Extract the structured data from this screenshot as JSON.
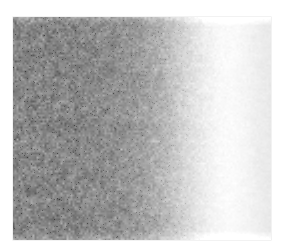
{
  "page": {
    "background_color": "#ffffff",
    "width": 285,
    "height": 249
  },
  "figure": {
    "name": "grayscale-gradient-micrograph",
    "plate": {
      "left": 13,
      "top": 17,
      "width": 258,
      "height": 223,
      "border_color": "#c8c8c8"
    }
  },
  "chart_data": {
    "type": "heatmap",
    "title": "",
    "subtitle": "",
    "xlabel": "",
    "ylabel": "",
    "colormap": "grayscale",
    "grid": false,
    "legend": "none",
    "axis_visible": false,
    "tick_labels_x": [],
    "tick_labels_y": [],
    "xlim": [
      0,
      258
    ],
    "ylim": [
      0,
      223
    ],
    "value_range": [
      0,
      255
    ],
    "x": [
      0,
      13,
      26,
      39,
      52,
      65,
      77,
      90,
      103,
      116,
      129,
      142,
      155,
      167,
      180,
      193,
      206,
      219,
      232,
      245,
      258
    ],
    "series": [
      {
        "name": "mean intensity (gray level 0-255)",
        "values": [
          136,
          135,
          134,
          134,
          135,
          136,
          138,
          141,
          145,
          151,
          160,
          173,
          190,
          208,
          226,
          240,
          249,
          251,
          246,
          238,
          233
        ]
      },
      {
        "name": "noise amplitude (gray level sigma)",
        "values": [
          30,
          30,
          29,
          29,
          28,
          28,
          27,
          26,
          25,
          24,
          22,
          20,
          17,
          14,
          11,
          8,
          5,
          4,
          4,
          4,
          4
        ]
      }
    ],
    "regions": [
      {
        "label": "dark granular field",
        "x_start": 0,
        "x_end": 120,
        "mean_gray": 136,
        "noise_sigma": 29
      },
      {
        "label": "gradient transition",
        "x_start": 120,
        "x_end": 180,
        "mean_gray": 190,
        "noise_sigma": 18
      },
      {
        "label": "bright band peak",
        "x_start": 180,
        "x_end": 215,
        "mean_gray": 249,
        "noise_sigma": 6
      },
      {
        "label": "right falloff",
        "x_start": 215,
        "x_end": 258,
        "mean_gray": 234,
        "noise_sigma": 4
      }
    ],
    "noise": {
      "grain_size_px": 1.6,
      "distribution": "gaussian",
      "seed": 20240517
    }
  }
}
